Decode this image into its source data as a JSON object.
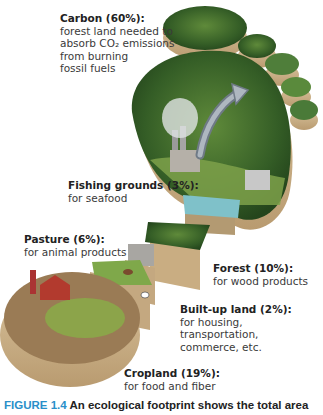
{
  "labels": {
    "carbon": {
      "title": "Carbon (60%):",
      "lines": [
        "forest land needed to",
        "absorb CO₂ emissions",
        "from burning",
        "fossil fuels"
      ]
    },
    "fishing": {
      "title": "Fishing grounds (3%):",
      "lines": [
        "for seafood"
      ]
    },
    "pasture": {
      "title": "Pasture (6%):",
      "lines": [
        "for animal products"
      ]
    },
    "forest": {
      "title": "Forest (10%):",
      "lines": [
        "for wood products"
      ]
    },
    "builtup": {
      "title": "Built-up land (2%):",
      "lines": [
        "for housing,",
        "transportation,",
        "commerce, etc."
      ]
    },
    "cropland": {
      "title": "Cropland (19%):",
      "lines": [
        "for food and fiber"
      ]
    }
  },
  "caption": {
    "figure": "FIGURE 1.4",
    "text": " An ecological footprint shows the total area"
  },
  "colors": {
    "figure_blue": "#2a8fc9",
    "forest_green": "#3f6b2a",
    "soil": "#c9b08a",
    "water": "#7fc1c9"
  }
}
